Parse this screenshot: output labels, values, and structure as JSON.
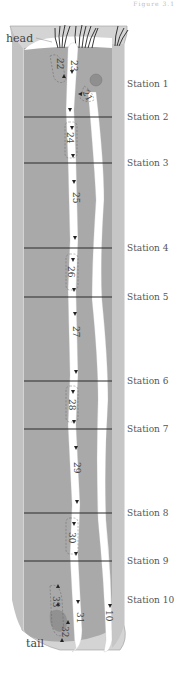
{
  "figure": {
    "caption_fragment": "Figure 3.1",
    "labels": {
      "head": "head",
      "tail": "tail"
    },
    "colors": {
      "body_fill": "#a8a8a8",
      "skin_light": "#d4d4d4",
      "skin_shadow": "#bdbdbd",
      "gut_stripe": "#ffffff",
      "station_line": "#2a2a2a",
      "label_text": "#555555"
    },
    "stations": [
      {
        "label": "Station 1",
        "y": 84,
        "line": false
      },
      {
        "label": "Station 2",
        "y": 117,
        "line": true
      },
      {
        "label": "Station 3",
        "y": 163,
        "line": true
      },
      {
        "label": "Station 4",
        "y": 248,
        "line": true
      },
      {
        "label": "Station 5",
        "y": 297,
        "line": true
      },
      {
        "label": "Station 6",
        "y": 381,
        "line": true
      },
      {
        "label": "Station 7",
        "y": 429,
        "line": true
      },
      {
        "label": "Station 8",
        "y": 513,
        "line": true
      },
      {
        "label": "Station 9",
        "y": 561,
        "line": true
      },
      {
        "label": "Station 10",
        "y": 600,
        "line": false
      }
    ],
    "segments": [
      {
        "label": "21",
        "x": 95,
        "y": 88
      },
      {
        "label": "22",
        "x": 60,
        "y": 62
      },
      {
        "label": "23",
        "x": 74,
        "y": 66
      },
      {
        "label": "24",
        "x": 70,
        "y": 140
      },
      {
        "label": "25",
        "x": 76,
        "y": 196
      },
      {
        "label": "26",
        "x": 71,
        "y": 272
      },
      {
        "label": "27",
        "x": 76,
        "y": 331
      },
      {
        "label": "28",
        "x": 72,
        "y": 405
      },
      {
        "label": "29",
        "x": 76,
        "y": 468
      },
      {
        "label": "30",
        "x": 72,
        "y": 538
      },
      {
        "label": "31",
        "x": 80,
        "y": 618
      },
      {
        "label": "32",
        "x": 60,
        "y": 640
      },
      {
        "label": "33",
        "x": 56,
        "y": 604
      },
      {
        "label": "10",
        "x": 110,
        "y": 618
      }
    ]
  }
}
